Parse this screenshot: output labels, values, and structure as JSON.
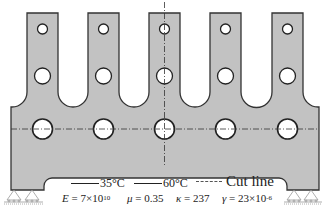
{
  "diagram": {
    "type": "structural-schematic",
    "colors": {
      "plate_fill": "#c2c2c2",
      "outline": "#333333",
      "hole_fill": "#ffffff",
      "cut_line": "#333333"
    },
    "fingers": 5,
    "holes_per_finger": 3
  },
  "legend": {
    "items": [
      {
        "label": "35°C",
        "style": "solid"
      },
      {
        "label": "60°C",
        "style": "solid"
      },
      {
        "label": "Cut line",
        "style": "dashed"
      }
    ]
  },
  "parameters": {
    "E_symbol": "E",
    "E_value": "= 7×10",
    "E_exp": "10",
    "mu_symbol": "μ",
    "mu_value": "= 0.35",
    "kappa_symbol": "κ",
    "kappa_value": "= 237",
    "gamma_symbol": "γ",
    "gamma_value": "= 23×10",
    "gamma_exp": "-6"
  }
}
